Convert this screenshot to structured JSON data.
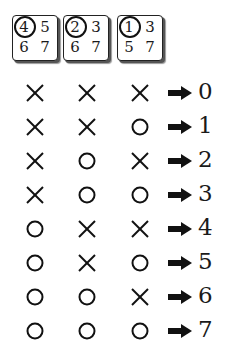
{
  "cards": [
    {
      "cells": [
        "4",
        "5",
        "6",
        "7"
      ],
      "circled_index": 0
    },
    {
      "cells": [
        "2",
        "3",
        "6",
        "7"
      ],
      "circled_index": 0
    },
    {
      "cells": [
        "1",
        "3",
        "5",
        "7"
      ],
      "circled_index": 0
    }
  ],
  "symbols": {
    "no": "cross-mark",
    "yes": "circle-mark",
    "arrow": "right-arrow"
  },
  "rows": [
    {
      "marks": [
        "x",
        "x",
        "x"
      ],
      "result": "0"
    },
    {
      "marks": [
        "x",
        "x",
        "o"
      ],
      "result": "1"
    },
    {
      "marks": [
        "x",
        "o",
        "x"
      ],
      "result": "2"
    },
    {
      "marks": [
        "x",
        "o",
        "o"
      ],
      "result": "3"
    },
    {
      "marks": [
        "o",
        "x",
        "x"
      ],
      "result": "4"
    },
    {
      "marks": [
        "o",
        "x",
        "o"
      ],
      "result": "5"
    },
    {
      "marks": [
        "o",
        "o",
        "x"
      ],
      "result": "6"
    },
    {
      "marks": [
        "o",
        "o",
        "o"
      ],
      "result": "7"
    }
  ]
}
